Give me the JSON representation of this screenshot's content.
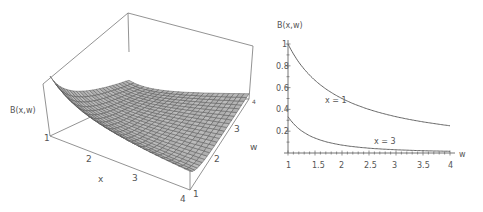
{
  "chart_data": [
    {
      "type": "surface3d",
      "title": "",
      "zlabel": "B(x,w)",
      "xlabel": "x",
      "ylabel": "w",
      "x_ticks": [
        "1",
        "2",
        "3",
        "4"
      ],
      "w_ticks": [
        "1",
        "2",
        "3",
        "4"
      ],
      "x_range": [
        1,
        4
      ],
      "w_range": [
        1,
        4
      ],
      "grid": true
    },
    {
      "type": "line",
      "title": "",
      "ylabel": "B(x,w)",
      "xlabel": "w",
      "x_ticks": [
        "1",
        "1.5",
        "2",
        "2.5",
        "3",
        "3.5",
        "4"
      ],
      "y_ticks": [
        "0.2",
        "0.4",
        "0.6",
        "0.8",
        "1"
      ],
      "xlim": [
        1,
        4
      ],
      "ylim": [
        0,
        1
      ],
      "series": [
        {
          "name": "x = 1",
          "x": [
            1,
            1.5,
            2,
            2.5,
            3,
            3.5,
            4
          ],
          "values": [
            1.0,
            0.67,
            0.5,
            0.4,
            0.33,
            0.29,
            0.25
          ]
        },
        {
          "name": "x = 3",
          "x": [
            1,
            1.5,
            2,
            2.5,
            3,
            3.5,
            4
          ],
          "values": [
            0.33,
            0.15,
            0.08,
            0.05,
            0.04,
            0.03,
            0.02
          ]
        }
      ]
    }
  ],
  "surface": {
    "zlabel": "B(x,w)",
    "xlabel": "x",
    "wlabel": "w",
    "x_tick_labels": [
      "1",
      "2",
      "3",
      "4"
    ],
    "w_tick_labels": [
      "1",
      "2",
      "3",
      "4"
    ]
  },
  "plot2d": {
    "ylabel": "B(x,w)",
    "xlabel": "w",
    "x_tick_labels": [
      "1",
      "1.5",
      "2",
      "2.5",
      "3",
      "3.5",
      "4"
    ],
    "y_tick_labels": [
      "0.2",
      "0.4",
      "0.6",
      "0.8",
      "1"
    ],
    "curve1_label": "x = 1",
    "curve2_label": "x = 3"
  }
}
